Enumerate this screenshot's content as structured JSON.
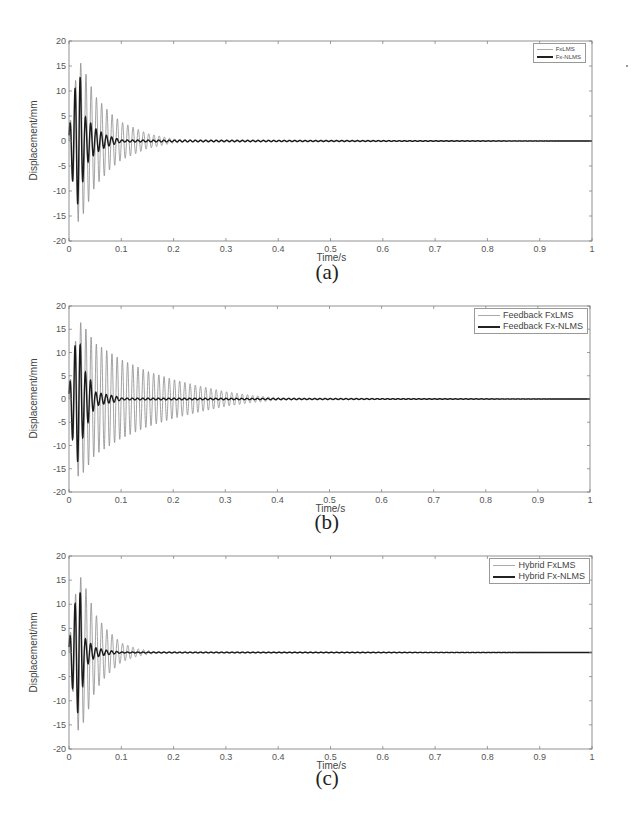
{
  "chart_data": [
    {
      "id": "a",
      "type": "line",
      "caption": "(a)",
      "title": "",
      "xlabel": "Time/s",
      "ylabel": "Displacement/mm",
      "xlim": [
        0,
        1
      ],
      "ylim": [
        -20,
        20
      ],
      "xticks": [
        "0",
        "0.1",
        "0.2",
        "0.3",
        "0.4",
        "0.5",
        "0.6",
        "0.7",
        "0.8",
        "0.9",
        "1"
      ],
      "yticks": [
        "20",
        "15",
        "10",
        "5",
        "0",
        "-5",
        "-10",
        "-15",
        "-20"
      ],
      "grid": false,
      "legend_position": "upper right",
      "oscillation_frequency_hz": 100,
      "series": [
        {
          "name": "FxLMS",
          "style": "thin gray",
          "peak": 16.5,
          "peak_time": 0.018,
          "settle_time": 0.25,
          "envelope": {
            "t": [
              0,
              0.018,
              0.03,
              0.05,
              0.08,
              0.1,
              0.15,
              0.2,
              0.25,
              1.0
            ],
            "amp": [
              2,
              16.5,
              14,
              9,
              5.5,
              3.8,
              1.5,
              0.4,
              0.05,
              0
            ]
          }
        },
        {
          "name": "Fx-NLMS",
          "style": "thick black",
          "peak": 9,
          "peak_time": 0.008,
          "settle_time": 0.1,
          "envelope": {
            "t": [
              0,
              0.008,
              0.02,
              0.03,
              0.05,
              0.07,
              0.1,
              1.0
            ],
            "amp": [
              2,
              9,
              14,
              5,
              2.5,
              1.2,
              0.2,
              0
            ]
          }
        }
      ]
    },
    {
      "id": "b",
      "type": "line",
      "caption": "(b)",
      "title": "",
      "xlabel": "Time/s",
      "ylabel": "Displacement/mm",
      "xlim": [
        0,
        1
      ],
      "ylim": [
        -20,
        20
      ],
      "xticks": [
        "0",
        "0.1",
        "0.2",
        "0.3",
        "0.4",
        "0.5",
        "0.6",
        "0.7",
        "0.8",
        "0.9",
        "1"
      ],
      "yticks": [
        "20",
        "15",
        "10",
        "5",
        "0",
        "-5",
        "-10",
        "-15",
        "-20"
      ],
      "grid": false,
      "legend_position": "upper right",
      "oscillation_frequency_hz": 100,
      "series": [
        {
          "name": "Feedback FxLMS",
          "style": "thin gray",
          "peak": 17,
          "peak_time": 0.018,
          "settle_time": 0.45,
          "envelope": {
            "t": [
              0,
              0.018,
              0.03,
              0.05,
              0.1,
              0.15,
              0.2,
              0.25,
              0.3,
              0.35,
              0.4,
              0.45,
              1.0
            ],
            "amp": [
              2,
              17,
              15.5,
              12,
              8.5,
              6,
              4.2,
              2.8,
              1.6,
              0.8,
              0.3,
              0.1,
              0
            ]
          }
        },
        {
          "name": "Feedback Fx-NLMS",
          "style": "thick black",
          "peak": 14,
          "peak_time": 0.018,
          "settle_time": 0.1,
          "envelope": {
            "t": [
              0,
              0.008,
              0.018,
              0.03,
              0.04,
              0.05,
              0.07,
              0.09,
              0.1,
              1.0
            ],
            "amp": [
              2,
              10,
              14,
              6,
              4.5,
              1.5,
              1.0,
              0.6,
              0.2,
              0
            ]
          }
        }
      ]
    },
    {
      "id": "c",
      "type": "line",
      "caption": "(c)",
      "title": "",
      "xlabel": "Time/s",
      "ylabel": "Displacement/mm",
      "xlim": [
        0,
        1
      ],
      "ylim": [
        -20,
        20
      ],
      "xticks": [
        "0",
        "0.1",
        "0.2",
        "0.3",
        "0.4",
        "0.5",
        "0.6",
        "0.7",
        "0.8",
        "0.9",
        "1"
      ],
      "yticks": [
        "20",
        "15",
        "10",
        "5",
        "0",
        "-5",
        "-10",
        "-15",
        "-20"
      ],
      "grid": false,
      "legend_position": "upper right",
      "oscillation_frequency_hz": 100,
      "series": [
        {
          "name": "Hybrid FxLMS",
          "style": "thin gray",
          "peak": 16.5,
          "peak_time": 0.018,
          "settle_time": 0.17,
          "envelope": {
            "t": [
              0,
              0.018,
              0.03,
              0.05,
              0.07,
              0.1,
              0.13,
              0.17,
              1.0
            ],
            "amp": [
              2,
              16.5,
              14,
              8,
              5,
              2,
              0.8,
              0.1,
              0
            ]
          }
        },
        {
          "name": "Hybrid Fx-NLMS",
          "style": "thick black",
          "peak": 8.5,
          "peak_time": 0.008,
          "settle_time": 0.1,
          "envelope": {
            "t": [
              0,
              0.008,
              0.02,
              0.03,
              0.05,
              0.07,
              0.1,
              1.0
            ],
            "amp": [
              2,
              8.5,
              14,
              3,
              1,
              0.5,
              0.1,
              0
            ]
          }
        }
      ]
    }
  ],
  "layout": [
    {
      "top": 41,
      "bottom": 241,
      "left": 69,
      "right": 592,
      "caption_top": 270
    },
    {
      "top": 306,
      "bottom": 492,
      "left": 69,
      "right": 590,
      "caption_top": 520
    },
    {
      "top": 556,
      "bottom": 749,
      "left": 69,
      "right": 592,
      "caption_top": 776
    }
  ]
}
